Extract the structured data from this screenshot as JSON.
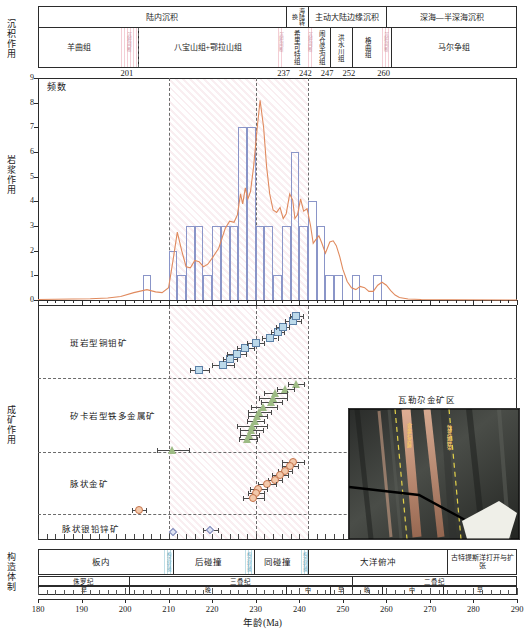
{
  "figure": {
    "x_axis": {
      "label": "年龄(Ma)",
      "min": 180,
      "max": 290,
      "ticks": [
        180,
        190,
        200,
        210,
        220,
        230,
        240,
        250,
        260,
        270,
        280,
        290
      ]
    }
  },
  "sediment_panel": {
    "side_label": "沉积作用",
    "boundary_labels": [
      {
        "text": "201",
        "age": 201
      },
      {
        "text": "237",
        "age": 237
      },
      {
        "text": "242",
        "age": 242
      },
      {
        "text": "247",
        "age": 247
      },
      {
        "text": "252",
        "age": 252
      },
      {
        "text": "260",
        "age": 260
      }
    ],
    "environments": [
      {
        "label": "陆内沉积",
        "start": 180,
        "end": 237
      },
      {
        "label": "海陆转换",
        "start": 237,
        "end": 242
      },
      {
        "label": "主动大陆边缘沉积",
        "start": 242,
        "end": 260
      },
      {
        "label": "深海—半深海沉积",
        "start": 260,
        "end": 290
      }
    ],
    "formations": [
      {
        "label": "羊曲组",
        "start": 180,
        "end": 199
      },
      {
        "label": "八宝山组+鄂拉山组",
        "start": 203,
        "end": 235
      },
      {
        "label": "希里可特组",
        "start": 236.5,
        "end": 242
      },
      {
        "label": "闹仓坚沟组",
        "start": 243,
        "end": 247
      },
      {
        "label": "洪水川组",
        "start": 247,
        "end": 252
      },
      {
        "label": "格曲组",
        "start": 252,
        "end": 259
      },
      {
        "label": "马尔争组",
        "start": 261,
        "end": 290
      }
    ],
    "gaps": [
      {
        "text": "沉积间断",
        "start": 199,
        "end": 203
      },
      {
        "text": "沉积间断",
        "start": 235,
        "end": 236.5
      },
      {
        "text": "沉积间断",
        "start": 242,
        "end": 243
      },
      {
        "text": "沉积间断",
        "start": 259,
        "end": 261
      }
    ]
  },
  "magmatism_panel": {
    "side_label": "岩浆作用",
    "y_label": "频数",
    "y_ticks": [
      0,
      1,
      2,
      3,
      4,
      5,
      6,
      7,
      8,
      9
    ],
    "dashed_ages": [
      210,
      230,
      242
    ],
    "shaded_range": [
      210,
      242
    ],
    "chart_data": {
      "type": "bar",
      "title": "岩浆作用频数直方图",
      "xlabel": "年龄(Ma)",
      "ylabel": "频数",
      "xlim": [
        180,
        290
      ],
      "ylim": [
        0,
        9
      ],
      "bin_width": 2,
      "grid": false,
      "legend": [],
      "bins": [
        {
          "start": 204,
          "end": 206,
          "value": 1
        },
        {
          "start": 210,
          "end": 212,
          "value": 2
        },
        {
          "start": 212,
          "end": 214,
          "value": 1
        },
        {
          "start": 214,
          "end": 216,
          "value": 3
        },
        {
          "start": 216,
          "end": 218,
          "value": 3
        },
        {
          "start": 218,
          "end": 220,
          "value": 1
        },
        {
          "start": 220,
          "end": 222,
          "value": 3
        },
        {
          "start": 222,
          "end": 224,
          "value": 3
        },
        {
          "start": 224,
          "end": 226,
          "value": 3
        },
        {
          "start": 226,
          "end": 228,
          "value": 7
        },
        {
          "start": 228,
          "end": 230,
          "value": 7
        },
        {
          "start": 230,
          "end": 232,
          "value": 3
        },
        {
          "start": 232,
          "end": 234,
          "value": 3
        },
        {
          "start": 234,
          "end": 236,
          "value": 1
        },
        {
          "start": 236,
          "end": 238,
          "value": 3
        },
        {
          "start": 238,
          "end": 240,
          "value": 6
        },
        {
          "start": 240,
          "end": 242,
          "value": 3
        },
        {
          "start": 242,
          "end": 244,
          "value": 4
        },
        {
          "start": 244,
          "end": 246,
          "value": 3
        },
        {
          "start": 246,
          "end": 248,
          "value": 1
        },
        {
          "start": 248,
          "end": 250,
          "value": 1
        },
        {
          "start": 252,
          "end": 254,
          "value": 1
        },
        {
          "start": 257,
          "end": 259,
          "value": 1
        }
      ],
      "kde_curve": [
        {
          "x": 180,
          "y": 0.02
        },
        {
          "x": 184,
          "y": 0.03
        },
        {
          "x": 188,
          "y": 0.04
        },
        {
          "x": 192,
          "y": 0.05
        },
        {
          "x": 196,
          "y": 0.08
        },
        {
          "x": 199,
          "y": 0.14
        },
        {
          "x": 202,
          "y": 0.3
        },
        {
          "x": 205,
          "y": 0.42
        },
        {
          "x": 207,
          "y": 0.33
        },
        {
          "x": 208.5,
          "y": 0.3
        },
        {
          "x": 210,
          "y": 0.5
        },
        {
          "x": 211,
          "y": 1.6
        },
        {
          "x": 212,
          "y": 2.75
        },
        {
          "x": 213,
          "y": 2.0
        },
        {
          "x": 214,
          "y": 1.35
        },
        {
          "x": 215,
          "y": 1.3
        },
        {
          "x": 216,
          "y": 1.6
        },
        {
          "x": 217,
          "y": 1.55
        },
        {
          "x": 218,
          "y": 1.35
        },
        {
          "x": 219,
          "y": 1.45
        },
        {
          "x": 220,
          "y": 1.7
        },
        {
          "x": 221.5,
          "y": 2.1
        },
        {
          "x": 223,
          "y": 2.9
        },
        {
          "x": 224,
          "y": 3.2
        },
        {
          "x": 225,
          "y": 3.15
        },
        {
          "x": 225.8,
          "y": 3.45
        },
        {
          "x": 226.5,
          "y": 4.3
        },
        {
          "x": 227,
          "y": 3.9
        },
        {
          "x": 227.6,
          "y": 4.55
        },
        {
          "x": 228.2,
          "y": 4.1
        },
        {
          "x": 228.8,
          "y": 4.4
        },
        {
          "x": 229.5,
          "y": 5.4
        },
        {
          "x": 230.3,
          "y": 6.9
        },
        {
          "x": 231,
          "y": 8.1
        },
        {
          "x": 231.8,
          "y": 7.0
        },
        {
          "x": 232.5,
          "y": 5.4
        },
        {
          "x": 233.2,
          "y": 4.3
        },
        {
          "x": 234,
          "y": 3.65
        },
        {
          "x": 234.8,
          "y": 3.55
        },
        {
          "x": 235.6,
          "y": 3.75
        },
        {
          "x": 236.3,
          "y": 3.3
        },
        {
          "x": 237,
          "y": 3.5
        },
        {
          "x": 237.8,
          "y": 4.3
        },
        {
          "x": 238.5,
          "y": 4.05
        },
        {
          "x": 239,
          "y": 3.3
        },
        {
          "x": 239.6,
          "y": 3.45
        },
        {
          "x": 240.3,
          "y": 4.1
        },
        {
          "x": 241,
          "y": 3.6
        },
        {
          "x": 241.8,
          "y": 3.7
        },
        {
          "x": 242.6,
          "y": 3.0
        },
        {
          "x": 243.2,
          "y": 2.3
        },
        {
          "x": 243.8,
          "y": 2.45
        },
        {
          "x": 244.5,
          "y": 2.6
        },
        {
          "x": 245.2,
          "y": 2.3
        },
        {
          "x": 246,
          "y": 1.9
        },
        {
          "x": 247,
          "y": 2.35
        },
        {
          "x": 247.8,
          "y": 2.4
        },
        {
          "x": 248.5,
          "y": 2.2
        },
        {
          "x": 249.3,
          "y": 1.75
        },
        {
          "x": 250,
          "y": 1.25
        },
        {
          "x": 251,
          "y": 0.75
        },
        {
          "x": 252,
          "y": 0.5
        },
        {
          "x": 253,
          "y": 0.42
        },
        {
          "x": 254,
          "y": 0.55
        },
        {
          "x": 255,
          "y": 0.5
        },
        {
          "x": 256,
          "y": 0.35
        },
        {
          "x": 257,
          "y": 0.35
        },
        {
          "x": 258,
          "y": 0.6
        },
        {
          "x": 259,
          "y": 0.72
        },
        {
          "x": 260,
          "y": 0.6
        },
        {
          "x": 261,
          "y": 0.38
        },
        {
          "x": 262,
          "y": 0.2
        },
        {
          "x": 263,
          "y": 0.1
        },
        {
          "x": 265,
          "y": 0.04
        },
        {
          "x": 268,
          "y": 0.02
        },
        {
          "x": 275,
          "y": 0.01
        },
        {
          "x": 290,
          "y": 0.0
        }
      ]
    }
  },
  "mineralization_panel": {
    "side_label": "成矿作用",
    "dashed_ages": [
      210,
      230,
      242
    ],
    "types": [
      {
        "label": "斑岩型铜钼矿",
        "marker": "square",
        "color": "#bcd9ea",
        "points": [
          {
            "age": 217.0,
            "err": 2.2
          },
          {
            "age": 222.5,
            "err": 2.6
          },
          {
            "age": 224.0,
            "err": 1.6
          },
          {
            "age": 225.6,
            "err": 2.2
          },
          {
            "age": 227.6,
            "err": 2.0
          },
          {
            "age": 230.0,
            "err": 2.0
          },
          {
            "age": 233.2,
            "err": 1.8
          },
          {
            "age": 235.0,
            "err": 1.6
          },
          {
            "age": 236.2,
            "err": 1.5
          },
          {
            "age": 238.6,
            "err": 1.8
          },
          {
            "age": 239.3,
            "err": 1.5
          }
        ]
      },
      {
        "label": "矽卡岩型铁多金属矿",
        "marker": "triangle",
        "color": "#9dbb84",
        "points": [
          {
            "age": 239.3,
            "err": 1.8
          },
          {
            "age": 236.8,
            "err": 2.0
          },
          {
            "age": 234.6,
            "err": 2.6
          },
          {
            "age": 234.0,
            "err": 3.2
          },
          {
            "age": 233.6,
            "err": 2.4
          },
          {
            "age": 231.8,
            "err": 3.0
          },
          {
            "age": 230.8,
            "err": 2.6
          },
          {
            "age": 230.4,
            "err": 2.2
          },
          {
            "age": 230.0,
            "err": 2.0
          },
          {
            "age": 229.2,
            "err": 3.4
          },
          {
            "age": 229.0,
            "err": 2.6
          },
          {
            "age": 228.6,
            "err": 2.2
          },
          {
            "age": 228.2,
            "err": 2.0
          },
          {
            "age": 211.0,
            "err": 3.6
          }
        ]
      },
      {
        "label": "脉状金矿",
        "marker": "circle",
        "color": "#f3c9ab",
        "points": [
          {
            "age": 238.6,
            "err": 2.6
          },
          {
            "age": 237.8,
            "err": 1.8
          },
          {
            "age": 236.8,
            "err": 1.6
          },
          {
            "age": 235.6,
            "err": 1.8
          },
          {
            "age": 234.4,
            "err": 1.6
          },
          {
            "age": 232.6,
            "err": 2.0
          },
          {
            "age": 230.6,
            "err": 2.0
          },
          {
            "age": 230.0,
            "err": 1.8
          },
          {
            "age": 229.4,
            "err": 2.4
          },
          {
            "age": 203.2,
            "err": 1.6
          }
        ]
      },
      {
        "label": "脉状银铅锌矿",
        "marker": "diamond",
        "color": "#dfe3f2",
        "points": [
          {
            "age": 211.0,
            "err": 0
          },
          {
            "age": 219.6,
            "err": 1.8
          }
        ]
      }
    ]
  },
  "photo_inset": {
    "caption": "瓦勒尕金矿区",
    "annotations": [
      "含金石英脉",
      "蚀变破碎带"
    ]
  },
  "tectonic_panel": {
    "side_label": "构造体制",
    "regimes": [
      {
        "label": "板内",
        "start": 180,
        "end": 209
      },
      {
        "label": "后碰撞",
        "start": 211,
        "end": 227.5
      },
      {
        "label": "同碰撞",
        "start": 229.5,
        "end": 240.5
      },
      {
        "label": "大洋俯冲",
        "start": 242,
        "end": 274
      },
      {
        "label": "古特提斯洋打开与扩张",
        "start": 274,
        "end": 290
      }
    ],
    "regime_transitions": [
      {
        "text": "构造转换",
        "start": 209,
        "end": 211
      },
      {
        "text": "构造转换",
        "start": 227.5,
        "end": 229.5
      },
      {
        "text": "构造转换",
        "start": 240.5,
        "end": 242
      }
    ],
    "periods": [
      {
        "label": "侏罗纪",
        "start": 180,
        "end": 201
      },
      {
        "label": "三叠纪",
        "start": 201,
        "end": 252
      },
      {
        "label": "二叠纪",
        "start": 252,
        "end": 290
      }
    ],
    "epochs": [
      {
        "label": "早",
        "start": 180,
        "end": 201
      },
      {
        "label": "晚",
        "start": 201,
        "end": 237
      },
      {
        "label": "中",
        "start": 237,
        "end": 247
      },
      {
        "label": "早",
        "start": 247,
        "end": 252
      },
      {
        "label": "晚",
        "start": 252,
        "end": 259
      },
      {
        "label": "中",
        "start": 259,
        "end": 273
      },
      {
        "label": "早",
        "start": 273,
        "end": 290
      }
    ]
  }
}
